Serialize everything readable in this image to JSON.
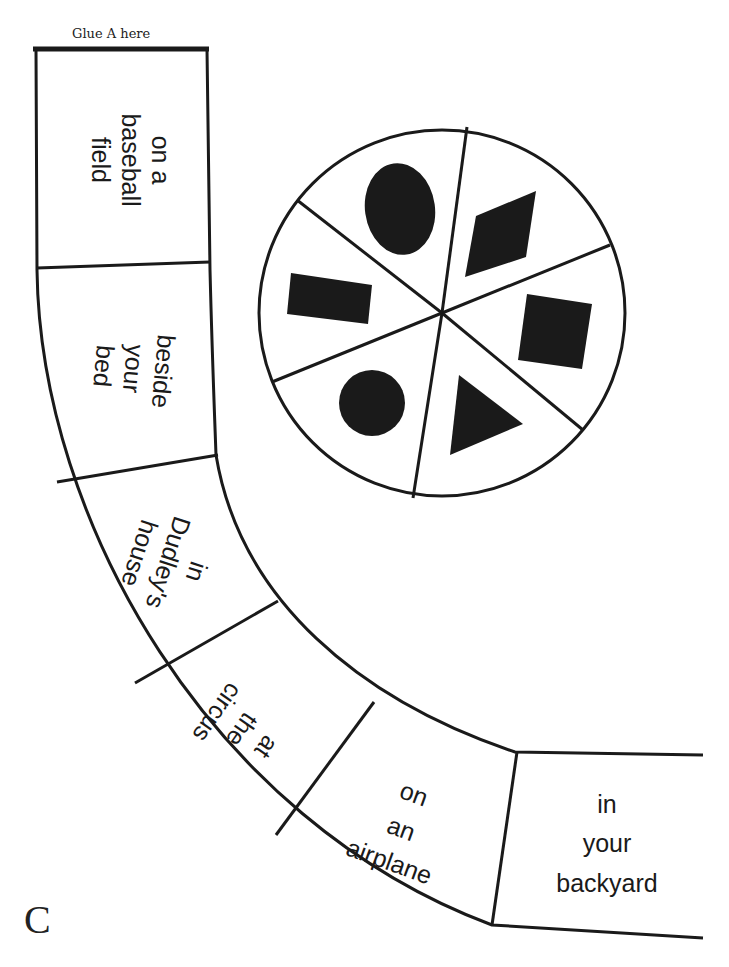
{
  "header": {
    "glue_label": "Glue A here"
  },
  "footer": {
    "page_letter": "C"
  },
  "path_spaces": [
    {
      "lines": [
        "on a",
        "baseball",
        "field"
      ]
    },
    {
      "lines": [
        "beside",
        "your",
        "bed"
      ]
    },
    {
      "lines": [
        "in",
        "Dudley's",
        "house"
      ]
    },
    {
      "lines": [
        "at",
        "the",
        "circus"
      ]
    },
    {
      "lines": [
        "on",
        "an",
        "airplane"
      ]
    },
    {
      "lines": [
        "in",
        "your",
        "backyard"
      ]
    }
  ],
  "spinner": {
    "sections": 6,
    "shapes": [
      "oval",
      "rhombus",
      "square",
      "triangle",
      "circle",
      "rectangle"
    ]
  },
  "colors": {
    "ink": "#1a1a1a",
    "paper": "#ffffff"
  }
}
